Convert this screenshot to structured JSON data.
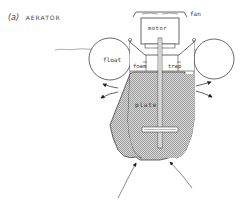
{
  "figure": {
    "title_prefix": "(a)",
    "title": "AERATOR"
  },
  "labels": {
    "fan": "fan",
    "motor": "motor",
    "float": "float",
    "foam": "foam",
    "trap": "trap",
    "plate": "plate"
  },
  "colors": {
    "line": "#444444",
    "fill_hatch": "#b5b5b5",
    "background": "#ffffff"
  }
}
